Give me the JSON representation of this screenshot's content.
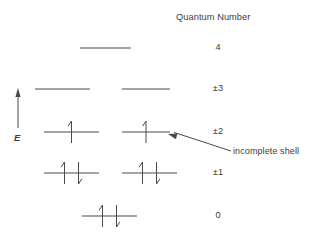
{
  "figure": {
    "title": "Quantum Number",
    "axis_label": "E",
    "annotation": "incomplete shell",
    "line_color": "#4a4a4a",
    "text_color": "#3d3d3d",
    "background": "#ffffff"
  },
  "levels": [
    {
      "quantum_number": "4",
      "y": 48,
      "label_y": 42,
      "orbitals": [
        {
          "x1": 80,
          "x2": 131,
          "electrons": []
        }
      ]
    },
    {
      "quantum_number": "±3",
      "y": 89,
      "label_y": 83,
      "orbitals": [
        {
          "x1": 35,
          "x2": 90,
          "electrons": []
        },
        {
          "x1": 122,
          "x2": 170,
          "electrons": []
        }
      ]
    },
    {
      "quantum_number": "±2",
      "y": 132,
      "label_y": 126,
      "orbitals": [
        {
          "x1": 44,
          "x2": 99,
          "electrons": [
            "up"
          ]
        },
        {
          "x1": 122,
          "x2": 170,
          "electrons": [
            "up"
          ]
        }
      ]
    },
    {
      "quantum_number": "±1",
      "y": 173,
      "label_y": 167,
      "orbitals": [
        {
          "x1": 44,
          "x2": 99,
          "electrons": [
            "up",
            "down"
          ]
        },
        {
          "x1": 122,
          "x2": 177,
          "electrons": [
            "up",
            "down"
          ]
        }
      ]
    },
    {
      "quantum_number": "0",
      "y": 216,
      "label_y": 210,
      "orbitals": [
        {
          "x1": 82,
          "x2": 137,
          "electrons": [
            "up",
            "down"
          ]
        }
      ]
    }
  ],
  "quantum_number_column_x": 218,
  "title_position": {
    "x": 176,
    "y": 12
  },
  "energy_axis": {
    "x": 18,
    "top_y": 88,
    "bottom_y": 128,
    "label_x": 14,
    "label_y": 132
  },
  "annotation_leader": {
    "tip_x": 168,
    "tip_y": 134,
    "tail_x": 231,
    "tail_y": 151,
    "text_x": 233,
    "text_y": 146
  }
}
